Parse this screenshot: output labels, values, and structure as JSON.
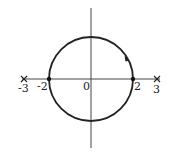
{
  "diagram": {
    "type": "root-locus / circle on real axis",
    "axis_labels": {
      "neg3": "-3",
      "neg2": "-2",
      "zero": "0",
      "pos2": "2",
      "pos3": "3"
    },
    "poles": [
      -3,
      3
    ],
    "zeros_or_points": [
      -2,
      2
    ],
    "circle": {
      "center": 0,
      "radius": 2,
      "direction": "clockwise"
    },
    "colors": {
      "stroke": "#222222",
      "background": "#ffffff"
    }
  }
}
